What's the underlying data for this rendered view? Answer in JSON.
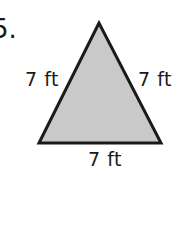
{
  "problem": {
    "number": "5.",
    "shape": "equilateral-triangle",
    "fill_color": "#c9c9c9",
    "stroke_color": "#1a1a1a",
    "sides": {
      "left": "7 ft",
      "right": "7 ft",
      "bottom": "7 ft"
    }
  }
}
